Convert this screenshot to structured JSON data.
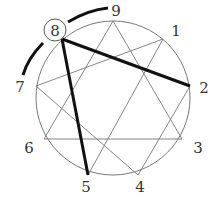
{
  "diagram": {
    "type": "enneagram",
    "highlighted_point": "8",
    "points": [
      {
        "label": "9",
        "x": 113,
        "y": 21,
        "lx": 116,
        "ly": 16
      },
      {
        "label": "1",
        "x": 163,
        "y": 39,
        "lx": 176,
        "ly": 36
      },
      {
        "label": "2",
        "x": 190,
        "y": 86,
        "lx": 204,
        "ly": 93
      },
      {
        "label": "3",
        "x": 182,
        "y": 139,
        "lx": 198,
        "ly": 153
      },
      {
        "label": "4",
        "x": 138,
        "y": 175,
        "lx": 140,
        "ly": 192
      },
      {
        "label": "5",
        "x": 88,
        "y": 175,
        "lx": 86,
        "ly": 192
      },
      {
        "label": "6",
        "x": 44,
        "y": 139,
        "lx": 29,
        "ly": 153
      },
      {
        "label": "7",
        "x": 36,
        "y": 86,
        "lx": 20,
        "ly": 92
      },
      {
        "label": "8",
        "x": 62,
        "y": 39,
        "lx": 54,
        "ly": 36
      }
    ],
    "thin_lines": [
      [
        "9",
        "3"
      ],
      [
        "9",
        "6"
      ],
      [
        "3",
        "6"
      ],
      [
        "1",
        "7"
      ],
      [
        "7",
        "4"
      ],
      [
        "4",
        "2"
      ],
      [
        "2",
        "8"
      ],
      [
        "8",
        "5"
      ],
      [
        "5",
        "1"
      ]
    ],
    "thick_lines": [
      [
        "8",
        "2"
      ],
      [
        "8",
        "5"
      ]
    ],
    "arcs": [
      "8-to-9 wing",
      "8-to-7 wing"
    ]
  }
}
